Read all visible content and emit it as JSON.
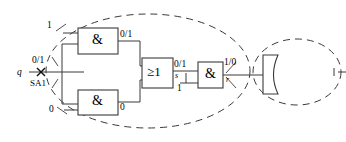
{
  "diagram": {
    "type": "logic-circuit-fault-propagation",
    "title": "",
    "stroke_color": "#3a3a3a",
    "text_color": "#111111",
    "background": "#ffffff",
    "input": {
      "name": "q",
      "fault_value": "0/1",
      "fault_type": "SA1",
      "fault_marker": "x"
    },
    "gates": [
      {
        "id": "and-top",
        "symbol": "&",
        "type": "AND",
        "input_labels": [
          "1"
        ],
        "output_label": "0/1"
      },
      {
        "id": "and-bottom",
        "symbol": "&",
        "type": "AND",
        "input_labels": [
          "0"
        ],
        "output_label": "0"
      },
      {
        "id": "or-gate",
        "symbol": "≥1",
        "type": "OR",
        "input_labels": [],
        "output_label": "0/1",
        "output_net": "s"
      },
      {
        "id": "and-right",
        "symbol": "&",
        "type": "AND",
        "input_labels": [
          "1"
        ],
        "output_label": "1/0",
        "output_net": "r"
      }
    ],
    "block": {
      "id": "memory-block",
      "label": ""
    },
    "regions": [
      {
        "id": "big-dashed-ellipse",
        "style": "dashed"
      },
      {
        "id": "small-dashed-ellipse",
        "style": "dashed"
      }
    ]
  }
}
